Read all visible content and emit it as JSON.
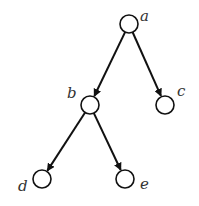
{
  "diagram": {
    "type": "tree",
    "directed": true,
    "colors": {
      "stroke": "#111111",
      "label": "#333333",
      "background": "#ffffff"
    },
    "nodes": [
      {
        "id": "a",
        "label": "a",
        "cx": 129,
        "cy": 24,
        "lx": 140,
        "ly": 21
      },
      {
        "id": "b",
        "label": "b",
        "cx": 90,
        "cy": 105,
        "lx": 67,
        "ly": 98
      },
      {
        "id": "c",
        "label": "c",
        "cx": 165,
        "cy": 105,
        "lx": 177,
        "ly": 96
      },
      {
        "id": "d",
        "label": "d",
        "cx": 42,
        "cy": 179,
        "lx": 18,
        "ly": 191
      },
      {
        "id": "e",
        "label": "e",
        "cx": 125,
        "cy": 179,
        "lx": 140,
        "ly": 189
      }
    ],
    "edges": [
      {
        "from": "a",
        "to": "b"
      },
      {
        "from": "a",
        "to": "c"
      },
      {
        "from": "b",
        "to": "d"
      },
      {
        "from": "b",
        "to": "e"
      }
    ]
  }
}
